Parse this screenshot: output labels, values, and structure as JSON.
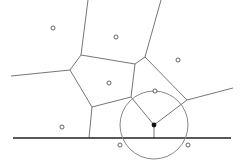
{
  "diagram": {
    "type": "voronoi-beachline",
    "colors": {
      "edge": "#777777",
      "site": "#555555",
      "line": "#222222",
      "circle": "#888888",
      "event": "#111111"
    },
    "sweep_line": {
      "x1": 13,
      "y1": 138,
      "x2": 231,
      "y2": 138
    },
    "circle_event": {
      "cx": 154,
      "cy": 125,
      "r": 34
    },
    "event_point": {
      "x": 154,
      "y": 125
    },
    "sites": [
      {
        "x": 53,
        "y": 28
      },
      {
        "x": 116,
        "y": 37
      },
      {
        "x": 178,
        "y": 60
      },
      {
        "x": 109,
        "y": 83
      },
      {
        "x": 62,
        "y": 127
      },
      {
        "x": 155,
        "y": 91
      },
      {
        "x": 120,
        "y": 145
      },
      {
        "x": 188,
        "y": 145
      }
    ],
    "edges": [
      {
        "x1": 88,
        "y1": 0,
        "x2": 81,
        "y2": 55
      },
      {
        "x1": 161,
        "y1": 0,
        "x2": 145,
        "y2": 57
      },
      {
        "x1": 81,
        "y1": 55,
        "x2": 135,
        "y2": 64
      },
      {
        "x1": 81,
        "y1": 55,
        "x2": 70,
        "y2": 70
      },
      {
        "x1": 70,
        "y1": 70,
        "x2": 11,
        "y2": 76
      },
      {
        "x1": 70,
        "y1": 70,
        "x2": 92,
        "y2": 107
      },
      {
        "x1": 135,
        "y1": 64,
        "x2": 145,
        "y2": 57
      },
      {
        "x1": 145,
        "y1": 57,
        "x2": 187,
        "y2": 100
      },
      {
        "x1": 135,
        "y1": 64,
        "x2": 131,
        "y2": 97
      },
      {
        "x1": 92,
        "y1": 107,
        "x2": 131,
        "y2": 97
      },
      {
        "x1": 92,
        "y1": 107,
        "x2": 89,
        "y2": 138
      },
      {
        "x1": 187,
        "y1": 100,
        "x2": 233,
        "y2": 88
      },
      {
        "x1": 131,
        "y1": 97,
        "x2": 154,
        "y2": 125
      },
      {
        "x1": 187,
        "y1": 100,
        "x2": 154,
        "y2": 125
      },
      {
        "x1": 154,
        "y1": 125,
        "x2": 154,
        "y2": 138
      }
    ]
  }
}
